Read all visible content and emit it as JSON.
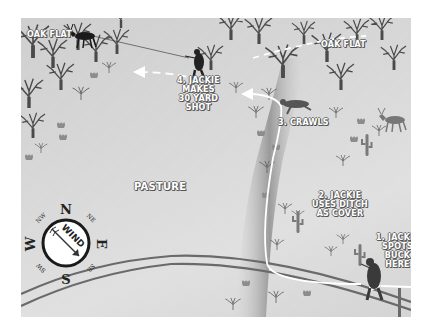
{
  "map": {
    "background_color": "#d6d6d6",
    "areas": {
      "oak_flat_left": "OAK FLAT",
      "oak_flat_right": "OAK FLAT",
      "pasture": "PASTURE"
    },
    "steps": [
      {
        "number": 1,
        "lines": [
          "1. JACKIE",
          "SPOTS",
          "BUCK",
          "HERE"
        ]
      },
      {
        "number": 2,
        "lines": [
          "2. JACKIE",
          "USES DITCH",
          "AS COVER"
        ]
      },
      {
        "number": 3,
        "lines": [
          "3. CRAWLS"
        ]
      },
      {
        "number": 4,
        "lines": [
          "4. JACKIE",
          "MAKES",
          "30 YARD",
          "SHOT"
        ]
      }
    ],
    "compass": {
      "directions": {
        "n": "N",
        "s": "S",
        "e": "E",
        "w": "W",
        "ne": "NE",
        "nw": "NW",
        "se": "SE",
        "sw": "SW"
      },
      "wind_label": "WIND",
      "wind_direction": "NW to SE"
    },
    "path_color": "#ffffff",
    "features": [
      "oak-trees",
      "cactus",
      "shrubs",
      "ditch",
      "fence-road",
      "buck",
      "hunter"
    ]
  }
}
